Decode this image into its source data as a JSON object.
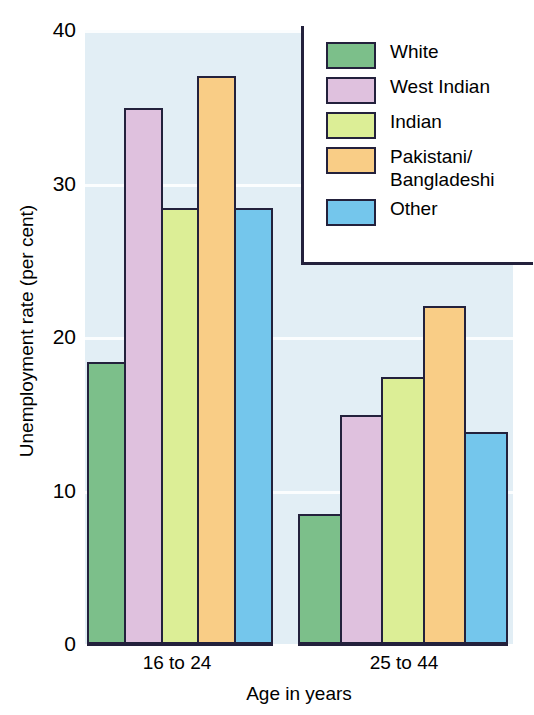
{
  "chart_data": {
    "type": "bar",
    "title": "",
    "xlabel": "Age in years",
    "ylabel": "Unemployment rate (per cent)",
    "categories": [
      "16 to 24",
      "25 to 44"
    ],
    "ylim": [
      0,
      40
    ],
    "yticks": [
      "0",
      "10",
      "20",
      "30",
      "40"
    ],
    "ytick_values": [
      0,
      10,
      20,
      30,
      40
    ],
    "grid": true,
    "legend_position": "top-right",
    "plot_background": "#e2eef5",
    "axis_color": "#23213c",
    "series": [
      {
        "name": "White",
        "color": "#7cbf8a",
        "values": [
          18.4,
          8.5
        ]
      },
      {
        "name": "West Indian",
        "color": "#dfc1de",
        "values": [
          34.9,
          14.9
        ]
      },
      {
        "name": "Indian",
        "color": "#dcee96",
        "values": [
          28.4,
          17.4
        ]
      },
      {
        "name": "Pakistani/\nBangladeshi",
        "color": "#f9cd86",
        "values": [
          37.0,
          22.0
        ]
      },
      {
        "name": "Other",
        "color": "#74c6ec",
        "values": [
          28.4,
          13.8
        ]
      }
    ]
  }
}
